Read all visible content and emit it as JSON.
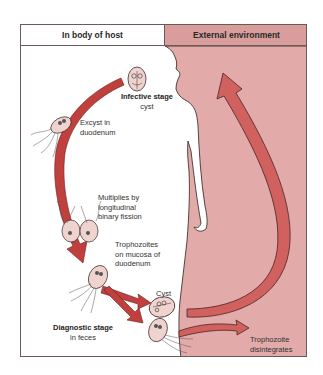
{
  "header": {
    "host_column": "In body of host",
    "environment_column": "External environment"
  },
  "colors": {
    "environment_fill": "#e2aaa9",
    "header_env_fill": "#d99d9c",
    "arrow_red": "#c9504d",
    "arrow_dark": "#a8312f",
    "cyst_fill": "#efd3cf",
    "outline": "#3a2a2a"
  },
  "labels": {
    "infective_stage": {
      "title": "Infective stage",
      "subtitle": "cyst"
    },
    "excyst": {
      "line1": "Excyst in",
      "line2": "duodenum"
    },
    "multiplies": {
      "line1": "Multiplies by",
      "line2": "longitudinal",
      "line3": "binary fission"
    },
    "trophozoites": {
      "line1": "Trophozoites",
      "line2": "on mucosa of",
      "line3": "duodenum"
    },
    "cyst": "Cyst",
    "diagnostic_stage": {
      "title": "Diagnostic stage",
      "subtitle": "in feces"
    },
    "trophozoite_disintegrates": {
      "line1": "Trophozoite",
      "line2": "disintegrates"
    }
  },
  "icons": [
    "cyst-icon",
    "trophozoite-icon",
    "human-silhouette",
    "cycle-arrow"
  ]
}
